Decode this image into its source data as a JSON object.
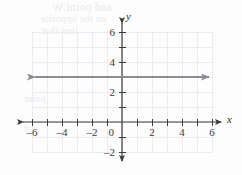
{
  "figure": {
    "kind": "coordinate-plane-graph",
    "axis_labels": {
      "x": "x",
      "y": "y"
    },
    "bleed_through_text": {
      "line1": "and point W",
      "line2": "on the opposite",
      "line3": "line that",
      "line4": "point",
      "line5": "if"
    }
  },
  "chart_data": {
    "type": "line",
    "title": "",
    "xlabel": "x",
    "ylabel": "y",
    "xlim": [
      -6.6,
      6.6
    ],
    "ylim": [
      -2.6,
      6.6
    ],
    "grid": true,
    "grid_xrange": [
      -6,
      6
    ],
    "grid_yrange": [
      -2,
      6
    ],
    "grid_step": 1,
    "legend": "none",
    "x_tick_values": [
      -6,
      -5,
      -4,
      -3,
      -2,
      -1,
      0,
      1,
      2,
      3,
      4,
      5,
      6
    ],
    "y_tick_values": [
      -2,
      -1,
      0,
      1,
      2,
      3,
      4,
      5,
      6
    ],
    "x_tick_labels": [
      "–6",
      "–4",
      "–2",
      "0",
      "2",
      "4",
      "6"
    ],
    "x_labeled_values": [
      -6,
      -4,
      -2,
      0,
      2,
      4,
      6
    ],
    "y_tick_labels": [
      "–2",
      "2",
      "4",
      "6"
    ],
    "y_labeled_values": [
      -2,
      2,
      4,
      6
    ],
    "origin_label": "0",
    "series": [
      {
        "name": "y = 3",
        "equation": "y = 3",
        "orientation": "horizontal",
        "constant_y": 3,
        "x_start": -5.8,
        "x_end": 5.8,
        "arrow_start": true,
        "arrow_end": true,
        "color": "#8c8c90",
        "points": [
          {
            "x": -5.8,
            "y": 3
          },
          {
            "x": 5.8,
            "y": 3
          }
        ]
      }
    ],
    "colors": {
      "line": "#8c8c90",
      "axis": "#3b3b3b",
      "grid": "#ececf0",
      "label": "#3b3b3b",
      "background": "#fdfdfd"
    }
  }
}
